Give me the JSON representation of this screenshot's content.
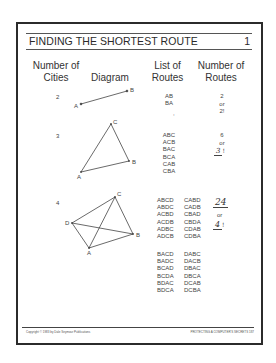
{
  "page": {
    "title": "FINDING THE SHORTEST ROUTE",
    "page_number": "1"
  },
  "table": {
    "headers": {
      "cities_line1": "Number of",
      "cities_line2": "Cities",
      "diagram": "Diagram",
      "routes_line1": "List of",
      "routes_line2": "Routes",
      "count_line1": "Number of",
      "count_line2": "Routes"
    },
    "rows": [
      {
        "cities": "2",
        "diagram_labels": {
          "A": "A",
          "B": "B"
        },
        "routes": [
          "AB",
          "BA"
        ],
        "stray_mark": ",",
        "count": {
          "value": "2",
          "or": "or",
          "factorial": "2!"
        }
      },
      {
        "cities": "3",
        "diagram_labels": {
          "A": "A",
          "B": "B",
          "C": "C"
        },
        "routes": [
          "ABC",
          "ACB",
          "BAC",
          "BCA",
          "CAB",
          "CBA"
        ],
        "count": {
          "value": "6",
          "or": "or",
          "factorial_base": "3",
          "factorial_bang": "!"
        }
      },
      {
        "cities": "4",
        "diagram_labels": {
          "A": "A",
          "B": "B",
          "C": "C",
          "D": "D"
        },
        "routes_col1": [
          "ABCD",
          "ABDC",
          "ACBD",
          "ACDB",
          "ADBC",
          "ADCB"
        ],
        "routes_col2": [
          "CABD",
          "CADB",
          "CBAD",
          "CBDA",
          "CDAB",
          "CDBA"
        ],
        "routes_col3": [
          "BACD",
          "BADC",
          "BCAD",
          "BCDA",
          "BDAC",
          "BDCA"
        ],
        "routes_col4": [
          "DABC",
          "DACB",
          "DBAC",
          "DBCA",
          "DCAB",
          "DCBA"
        ],
        "count": {
          "value": "24",
          "or": "or",
          "factorial_base": "4",
          "factorial_bang": "!"
        }
      }
    ]
  },
  "footer": {
    "copyright": "Copyright © 1983 by Dale Seymour Publications",
    "book": "PROTECTING A COMPUTER'S SECRETS   187"
  }
}
